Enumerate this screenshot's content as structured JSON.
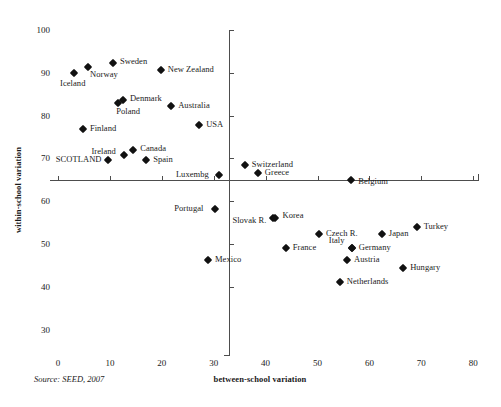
{
  "chart_data": {
    "type": "scatter",
    "title": "",
    "xlabel": "between-school variation",
    "ylabel": "within-school variation",
    "xlim": [
      0,
      80
    ],
    "ylim": [
      30,
      100
    ],
    "xticks": [
      0,
      10,
      20,
      30,
      40,
      50,
      60,
      70,
      80
    ],
    "yticks": [
      30,
      40,
      50,
      60,
      70,
      80,
      90,
      100
    ],
    "grid": false,
    "legend": "none",
    "source": "Source: SEED, 2007",
    "crosshair_axes": {
      "x_at": 33,
      "y_at": 65
    },
    "points": [
      {
        "label": "Iceland",
        "x": 3.1,
        "y": 90.0,
        "label_dx": -14,
        "label_dy": 10
      },
      {
        "label": "Norway",
        "x": 5.8,
        "y": 91.2,
        "label_dx": 2,
        "label_dy": 7
      },
      {
        "label": "Sweden",
        "x": 10.6,
        "y": 92.3,
        "label_dx": 7,
        "label_dy": -2
      },
      {
        "label": "New Zealand",
        "x": 19.8,
        "y": 90.5,
        "label_dx": 7,
        "label_dy": -1
      },
      {
        "label": "Denmark",
        "x": 12.5,
        "y": 83.6,
        "label_dx": 7,
        "label_dy": -2
      },
      {
        "label": "Poland",
        "x": 11.6,
        "y": 82.9,
        "label_dx": -2,
        "label_dy": 8
      },
      {
        "label": "Australia",
        "x": 21.8,
        "y": 82.2,
        "label_dx": 7,
        "label_dy": -1
      },
      {
        "label": "USA",
        "x": 27.2,
        "y": 77.8,
        "label_dx": 7,
        "label_dy": -1
      },
      {
        "label": "Finland",
        "x": 4.8,
        "y": 76.9,
        "label_dx": 7,
        "label_dy": -1
      },
      {
        "label": "SCOTLAND",
        "x": 9.6,
        "y": 69.6,
        "label_dx": -52,
        "label_dy": -1
      },
      {
        "label": "Ireland",
        "x": 12.8,
        "y": 70.7,
        "label_dx": -33,
        "label_dy": -4
      },
      {
        "label": "Canada",
        "x": 14.5,
        "y": 71.9,
        "label_dx": 7,
        "label_dy": -2
      },
      {
        "label": "Spain",
        "x": 17.0,
        "y": 69.6,
        "label_dx": 7,
        "label_dy": -1
      },
      {
        "label": "Luxembg",
        "x": 31.0,
        "y": 66.1,
        "label_dx": -43,
        "label_dy": -1
      },
      {
        "label": "Switzerland",
        "x": 36.0,
        "y": 68.4,
        "label_dx": 7,
        "label_dy": -1
      },
      {
        "label": "Greece",
        "x": 38.5,
        "y": 66.5,
        "label_dx": 7,
        "label_dy": -1
      },
      {
        "label": "Belgium",
        "x": 56.5,
        "y": 64.9,
        "label_dx": 7,
        "label_dy": 1
      },
      {
        "label": "Portugal",
        "x": 30.3,
        "y": 58.3,
        "label_dx": -41,
        "label_dy": -1
      },
      {
        "label": "Slovak R.",
        "x": 41.5,
        "y": 56.0,
        "label_dx": -41,
        "label_dy": 2
      },
      {
        "label": "Korea",
        "x": 41.9,
        "y": 56.0,
        "label_dx": 7,
        "label_dy": -3
      },
      {
        "label": "Czech R.",
        "x": 50.3,
        "y": 52.4,
        "label_dx": 7,
        "label_dy": -1
      },
      {
        "label": "Japan",
        "x": 62.4,
        "y": 52.4,
        "label_dx": 7,
        "label_dy": -1
      },
      {
        "label": "Turkey",
        "x": 69.1,
        "y": 54.1,
        "label_dx": 7,
        "label_dy": -1
      },
      {
        "label": "France",
        "x": 43.9,
        "y": 49.1,
        "label_dx": 7,
        "label_dy": -1
      },
      {
        "label": "Italy",
        "x": 56.6,
        "y": 49.1,
        "label_dx": -23,
        "label_dy": -8
      },
      {
        "label": "Germany",
        "x": 56.6,
        "y": 49.1,
        "label_dx": 7,
        "label_dy": -1
      },
      {
        "label": "Austria",
        "x": 55.7,
        "y": 46.3,
        "label_dx": 7,
        "label_dy": -1
      },
      {
        "label": "Hungary",
        "x": 66.5,
        "y": 44.4,
        "label_dx": 7,
        "label_dy": -1
      },
      {
        "label": "Mexico",
        "x": 28.9,
        "y": 46.3,
        "label_dx": 7,
        "label_dy": -1
      },
      {
        "label": "Netherlands",
        "x": 54.3,
        "y": 41.2,
        "label_dx": 7,
        "label_dy": -1
      }
    ]
  },
  "axes": {
    "y_title": "within-school variation",
    "x_title": "between-school variation",
    "source_note": "Source: SEED, 2007",
    "x_tick_labels": [
      "0",
      "10",
      "20",
      "30",
      "40",
      "50",
      "60",
      "70",
      "80"
    ],
    "y_tick_labels": [
      "30",
      "40",
      "50",
      "60",
      "70",
      "80",
      "90",
      "100"
    ]
  },
  "style": {
    "marker_color": "#111111",
    "axis_color": "#4d4d4d",
    "text_color": "#1a1a1a",
    "background": "#ffffff"
  }
}
